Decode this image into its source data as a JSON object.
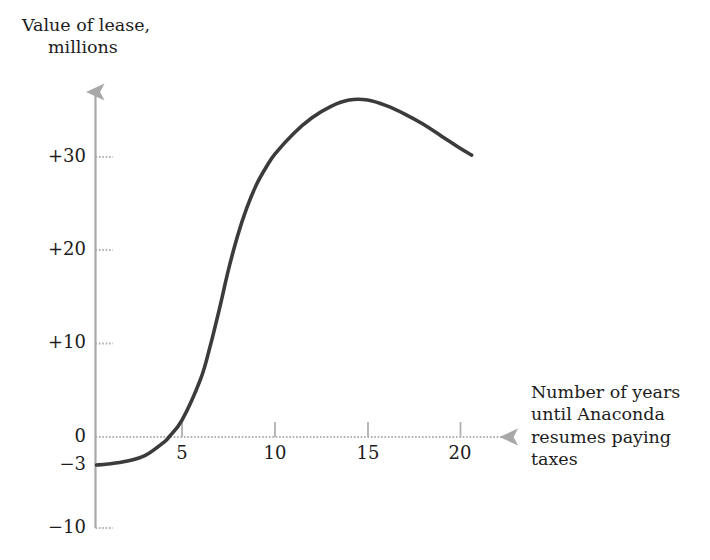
{
  "chart_data": {
    "type": "line",
    "title": "",
    "subtitle": "",
    "ylabel_line1": "Value of lease,",
    "ylabel_line2": "millions",
    "xlabel_line1": "Number of years",
    "xlabel_line2": "until Anaconda",
    "xlabel_line3": "resumes paying",
    "xlabel_line4": "taxes",
    "xlabel_full": "Number of years until Anaconda resumes paying taxes",
    "ylabel_full": "Value of lease, millions",
    "x_ticks": [
      5,
      10,
      15,
      20
    ],
    "x_tick_labels": [
      "5",
      "10",
      "15",
      "20"
    ],
    "y_ticks": [
      -10,
      -3,
      0,
      10,
      20,
      30
    ],
    "y_tick_labels": [
      "−10",
      "−3",
      "0",
      "+10",
      "+20",
      "+30"
    ],
    "xlim": [
      0,
      22.8
    ],
    "ylim": [
      -10,
      38
    ],
    "grid": false,
    "legend": null,
    "zero_line": true,
    "series": [
      {
        "name": "Value of lease",
        "x": [
          0.4,
          1.0,
          2.0,
          3.0,
          4.0,
          4.3,
          5.0,
          6.0,
          6.5,
          7.0,
          7.5,
          8.0,
          8.5,
          9.0,
          9.5,
          10.0,
          11.0,
          12.0,
          13.0,
          14.0,
          15.0,
          16.0,
          17.0,
          18.0,
          19.0,
          20.0,
          20.6
        ],
        "y": [
          -3.0,
          -2.9,
          -2.6,
          -2.0,
          -0.6,
          0.0,
          1.8,
          6.2,
          9.6,
          13.6,
          17.9,
          21.6,
          24.6,
          27.0,
          28.8,
          30.3,
          32.5,
          34.2,
          35.4,
          36.1,
          36.1,
          35.5,
          34.6,
          33.5,
          32.2,
          30.9,
          30.2
        ]
      }
    ],
    "annotations": {
      "start_value": -3,
      "zero_crossing_x": 4.3,
      "peak_x": 14,
      "peak_y": 36,
      "end_x": 20.6,
      "end_y": 30
    },
    "colors": {
      "curve": "#3b3b3b",
      "axis": "#a8a8a8",
      "text": "#1c1c1c",
      "background": "#ffffff"
    }
  }
}
